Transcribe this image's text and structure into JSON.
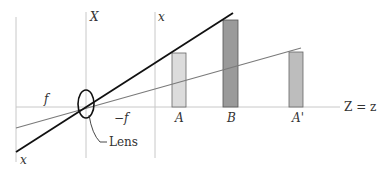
{
  "diagram": {
    "colors": {
      "background": "#ffffff",
      "guide_line": "#c8c8c8",
      "axis_line": "#c8c8c8",
      "thick_ray": "#111111",
      "thin_ray": "#7a7a7a",
      "bar_A_fill": "#dcdcdc",
      "bar_B_fill": "#9a9a9a",
      "bar_Aprime_fill": "#bdbdbd",
      "bar_stroke": "#666666",
      "text": "#333333"
    },
    "labels": {
      "X_axis": "X",
      "x_axis_top": "x",
      "x_axis_bottom": "x",
      "f": "f",
      "minus_f": "−f",
      "A": "A",
      "B": "B",
      "A_prime": "A'",
      "optical_axis": "Z = z",
      "lens": "Lens"
    },
    "bars": [
      {
        "name": "A",
        "label": "A",
        "x": 172,
        "width": 14,
        "top": 53,
        "shade": "light"
      },
      {
        "name": "B",
        "label": "B",
        "x": 223,
        "width": 15,
        "top": 20,
        "shade": "dark"
      },
      {
        "name": "A-prime",
        "label": "A'",
        "x": 289,
        "width": 14,
        "top": 52,
        "shade": "medium"
      }
    ],
    "rays": [
      {
        "name": "thick-ray",
        "from": [
          16,
          152
        ],
        "to": [
          233,
          13
        ],
        "weight": "thick"
      },
      {
        "name": "thin-ray",
        "from": [
          16,
          128
        ],
        "to": [
          301,
          48
        ],
        "weight": "thin"
      }
    ],
    "lens": {
      "cx": 86,
      "cy": 104,
      "rx": 8,
      "ry": 14
    }
  }
}
